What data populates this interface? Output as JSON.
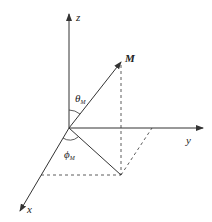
{
  "diagram": {
    "type": "3d-coordinate-system",
    "colors": {
      "line": "#333333",
      "background": "#ffffff"
    },
    "axes": {
      "z": {
        "label": "z"
      },
      "y": {
        "label": "y"
      },
      "x": {
        "label": "x"
      }
    },
    "vector": {
      "label": "M"
    },
    "angles": {
      "theta": {
        "symbol": "θ",
        "subscript": "M"
      },
      "phi": {
        "symbol": "ϕ",
        "subscript": "M"
      }
    }
  }
}
